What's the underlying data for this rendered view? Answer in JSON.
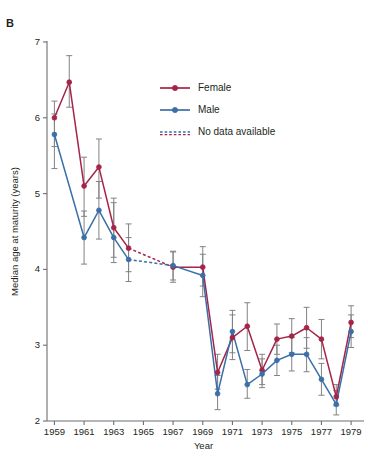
{
  "panel": {
    "label": "B"
  },
  "colors": {
    "female": "#a52448",
    "male": "#3a6fa8",
    "error_bar": "#808285",
    "axis": "#6d6e71",
    "text": "#231f20",
    "background": "#ffffff"
  },
  "legend": {
    "position": "upper-right-inside",
    "items": [
      {
        "label": "Female",
        "style": "solid-marker",
        "color": "#a52448"
      },
      {
        "label": "Male",
        "style": "solid-marker",
        "color": "#3a6fa8"
      },
      {
        "label": "No data available",
        "style": "dotted",
        "color": "#3a6fa8"
      }
    ]
  },
  "chart_data": {
    "type": "line",
    "title": "",
    "xlabel": "Year",
    "ylabel": "Median age at maturity (years)",
    "xlim": [
      1958.5,
      1979.6
    ],
    "ylim": [
      2,
      7
    ],
    "yticks": [
      2,
      3,
      4,
      5,
      6,
      7
    ],
    "xticks": [
      1959,
      1961,
      1963,
      1965,
      1967,
      1969,
      1971,
      1973,
      1975,
      1977,
      1979
    ],
    "xtick_labels": [
      "1959",
      "1961",
      "1963",
      "1965",
      "1967",
      "1969",
      "1971",
      "1973",
      "1975",
      "1977",
      "1979"
    ],
    "ytick_labels": [
      "2",
      "3",
      "4",
      "5",
      "6",
      "7"
    ],
    "grid": false,
    "error_bars": "vertical",
    "series": [
      {
        "name": "Female",
        "color": "#a52448",
        "x": [
          1959,
          1960,
          1961,
          1962,
          1963,
          1964,
          1967,
          1969,
          1970,
          1971,
          1972,
          1973,
          1974,
          1975,
          1976,
          1977,
          1978,
          1979
        ],
        "values": [
          6.0,
          6.47,
          5.1,
          5.35,
          4.55,
          4.28,
          4.03,
          4.03,
          2.64,
          3.1,
          3.25,
          2.67,
          3.08,
          3.12,
          3.23,
          3.08,
          2.32,
          3.3
        ],
        "err_low": [
          5.62,
          6.14,
          4.7,
          4.94,
          4.16,
          3.97,
          3.83,
          3.78,
          2.42,
          2.81,
          2.93,
          2.48,
          2.88,
          2.9,
          2.96,
          2.82,
          2.2,
          3.1
        ],
        "err_high": [
          6.22,
          6.82,
          5.48,
          5.72,
          4.94,
          4.6,
          4.23,
          4.3,
          2.88,
          3.4,
          3.56,
          2.88,
          3.28,
          3.35,
          3.5,
          3.34,
          2.48,
          3.52
        ],
        "dashed_segment": [
          1964,
          1967
        ]
      },
      {
        "name": "Male",
        "color": "#3a6fa8",
        "x": [
          1959,
          1961,
          1962,
          1963,
          1964,
          1967,
          1969,
          1970,
          1971,
          1972,
          1973,
          1974,
          1975,
          1976,
          1977,
          1978,
          1979
        ],
        "values": [
          5.78,
          4.42,
          4.78,
          4.42,
          4.13,
          4.05,
          3.92,
          2.36,
          3.18,
          2.48,
          2.62,
          2.8,
          2.88,
          2.88,
          2.55,
          2.22,
          3.18
        ],
        "err_low": [
          5.33,
          4.07,
          4.4,
          4.09,
          3.84,
          3.86,
          3.64,
          2.15,
          2.9,
          2.3,
          2.44,
          2.6,
          2.66,
          2.65,
          2.34,
          2.08,
          2.97
        ],
        "err_high": [
          6.05,
          4.77,
          5.16,
          4.88,
          4.42,
          4.24,
          4.2,
          2.6,
          3.46,
          2.68,
          2.82,
          3.0,
          3.1,
          3.1,
          2.76,
          2.4,
          3.4
        ],
        "dashed_segment": [
          1964,
          1967
        ]
      }
    ]
  }
}
